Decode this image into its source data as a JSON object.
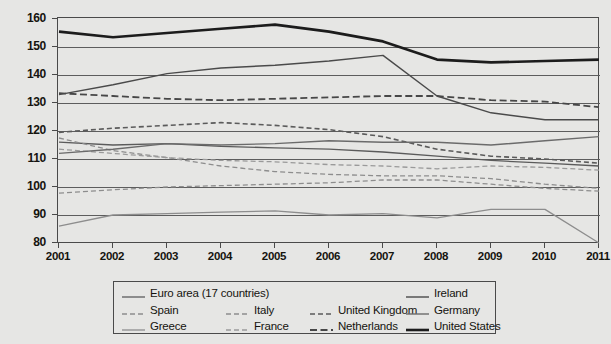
{
  "chart_data": {
    "type": "line",
    "title": "",
    "subtitle": "",
    "xlabel": "",
    "ylabel": "",
    "x": [
      2001,
      2002,
      2003,
      2004,
      2005,
      2006,
      2007,
      2008,
      2009,
      2010,
      2011
    ],
    "xtick_labels": [
      "2001",
      "2002",
      "2003",
      "2004",
      "2005",
      "2006",
      "2007",
      "2008",
      "2009",
      "2010",
      "2011"
    ],
    "ytick_labels": [
      "80",
      "90",
      "100",
      "110",
      "120",
      "130",
      "140",
      "150",
      "160"
    ],
    "yticks": [
      80,
      90,
      100,
      110,
      120,
      130,
      140,
      150,
      160
    ],
    "ylim": [
      80,
      160
    ],
    "xlim": [
      2001,
      2011
    ],
    "grid": "horizontal",
    "legend_position": "below",
    "series": [
      {
        "name": "Euro area (17 countries)",
        "style": "solid",
        "color": "#5b5b5b",
        "width": 1.3,
        "values": [
          116.0,
          115.0,
          115.5,
          114.5,
          114.0,
          113.5,
          112.5,
          111.0,
          109.5,
          108.5,
          107.5
        ]
      },
      {
        "name": "Spain",
        "style": "dashed",
        "color": "#8d8d8d",
        "width": 1.3,
        "values": [
          97.8,
          99.0,
          100.0,
          100.5,
          101.0,
          101.5,
          102.5,
          102.5,
          101.0,
          99.5,
          98.5
        ]
      },
      {
        "name": "Greece",
        "style": "solid",
        "color": "#8d8d8d",
        "width": 1.3,
        "values": [
          86.0,
          90.0,
          90.5,
          91.0,
          91.5,
          90.0,
          90.5,
          89.0,
          92.0,
          92.0,
          80.0
        ]
      },
      {
        "name": "Italy",
        "style": "dashed",
        "color": "#8d8d8d",
        "width": 1.3,
        "values": [
          117.5,
          113.0,
          110.5,
          107.5,
          105.5,
          104.5,
          104.0,
          104.0,
          103.0,
          101.0,
          99.5
        ]
      },
      {
        "name": "France",
        "style": "dashed",
        "color": "#9a9a9a",
        "width": 1.3,
        "values": [
          113.5,
          112.0,
          110.5,
          109.5,
          109.0,
          108.0,
          107.5,
          106.5,
          107.5,
          107.0,
          106.0
        ]
      },
      {
        "name": "United Kingdom",
        "style": "dashed",
        "color": "#5b5b5b",
        "width": 1.6,
        "values": [
          119.5,
          121.0,
          122.0,
          123.0,
          122.0,
          120.5,
          118.0,
          113.5,
          111.0,
          110.0,
          108.5
        ]
      },
      {
        "name": "Netherlands",
        "style": "dashed",
        "color": "#474747",
        "width": 1.8,
        "values": [
          133.5,
          132.5,
          131.5,
          131.0,
          131.5,
          132.0,
          132.5,
          132.5,
          131.0,
          130.5,
          128.5
        ]
      },
      {
        "name": "Ireland",
        "style": "solid",
        "color": "#4a4a4a",
        "width": 1.4,
        "values": [
          133.0,
          136.5,
          140.5,
          142.5,
          143.5,
          145.0,
          147.0,
          132.5,
          126.5,
          124.0,
          124.0
        ]
      },
      {
        "name": "Germany",
        "style": "solid",
        "color": "#6b6b6b",
        "width": 1.4,
        "values": [
          112.0,
          113.5,
          115.5,
          115.0,
          115.5,
          116.5,
          116.0,
          116.0,
          115.0,
          116.5,
          118.0
        ]
      },
      {
        "name": "United States",
        "style": "solid",
        "color": "#1c1c1c",
        "width": 2.6,
        "values": [
          155.5,
          153.5,
          155.0,
          156.5,
          158.0,
          155.5,
          152.0,
          145.5,
          144.5,
          145.0,
          145.5
        ]
      }
    ]
  },
  "legend": {
    "rows": [
      [
        {
          "label": "Euro area (17 countries)",
          "series": 0
        },
        {
          "label": "Ireland",
          "series": 7
        }
      ],
      [
        {
          "label": "Spain",
          "series": 1
        },
        {
          "label": "Italy",
          "series": 3
        },
        {
          "label": "United Kingdom",
          "series": 5
        },
        {
          "label": "Germany",
          "series": 8
        }
      ],
      [
        {
          "label": "Greece",
          "series": 2
        },
        {
          "label": "France",
          "series": 4
        },
        {
          "label": "Netherlands",
          "series": 6
        },
        {
          "label": "United States",
          "series": 9
        }
      ]
    ]
  }
}
